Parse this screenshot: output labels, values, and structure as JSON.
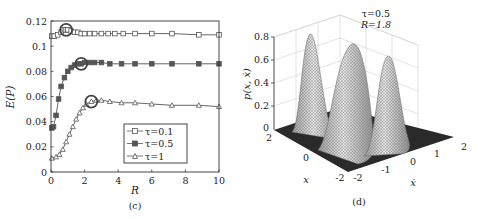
{
  "chart_data": [
    {
      "id": "c",
      "type": "line",
      "caption": "(c)",
      "title": "",
      "xlabel": "R",
      "ylabel": "E(P)",
      "xlim": [
        0,
        10
      ],
      "ylim": [
        0,
        0.12
      ],
      "xticks": [
        "0",
        "2",
        "4",
        "6",
        "8",
        "10"
      ],
      "yticks": [
        "0",
        "0.02",
        "0.04",
        "0.06",
        "0.08",
        "0.1",
        "0.12"
      ],
      "grid": false,
      "legend_position": "lower right",
      "series": [
        {
          "name": "τ=0.1",
          "marker": "square-open",
          "x": [
            0.05,
            0.2,
            0.4,
            0.6,
            0.8,
            0.9,
            1.0,
            1.2,
            1.4,
            1.6,
            1.8,
            2.0,
            2.3,
            2.6,
            3.0,
            3.4,
            3.8,
            4.3,
            5.0,
            6.0,
            7.2,
            8.8,
            10.0
          ],
          "values": [
            0.108,
            0.108,
            0.109,
            0.111,
            0.113,
            0.113,
            0.113,
            0.112,
            0.111,
            0.111,
            0.11,
            0.11,
            0.11,
            0.11,
            0.11,
            0.11,
            0.11,
            0.11,
            0.11,
            0.11,
            0.11,
            0.109,
            0.109
          ],
          "highlight": {
            "x": 0.9,
            "y": 0.113
          }
        },
        {
          "name": "τ=0.5",
          "marker": "square-filled",
          "x": [
            0.05,
            0.15,
            0.3,
            0.45,
            0.6,
            0.8,
            1.0,
            1.2,
            1.4,
            1.6,
            1.8,
            2.0,
            2.3,
            2.6,
            3.0,
            3.5,
            4.2,
            5.0,
            6.0,
            7.2,
            8.8,
            10.0
          ],
          "values": [
            0.035,
            0.036,
            0.045,
            0.058,
            0.068,
            0.075,
            0.08,
            0.083,
            0.085,
            0.086,
            0.086,
            0.087,
            0.087,
            0.087,
            0.087,
            0.086,
            0.086,
            0.086,
            0.086,
            0.086,
            0.086,
            0.086
          ],
          "highlight": {
            "x": 1.8,
            "y": 0.086
          }
        },
        {
          "name": "τ=1",
          "marker": "triangle-open",
          "x": [
            0.05,
            0.3,
            0.5,
            0.7,
            0.9,
            1.1,
            1.3,
            1.5,
            1.7,
            1.9,
            2.1,
            2.4,
            2.7,
            3.0,
            3.5,
            4.2,
            5.0,
            6.0,
            7.2,
            8.8,
            10.0
          ],
          "values": [
            0.011,
            0.012,
            0.014,
            0.018,
            0.024,
            0.03,
            0.036,
            0.042,
            0.047,
            0.051,
            0.054,
            0.056,
            0.057,
            0.057,
            0.056,
            0.055,
            0.055,
            0.054,
            0.053,
            0.053,
            0.052
          ],
          "highlight": {
            "x": 2.4,
            "y": 0.056
          }
        }
      ]
    },
    {
      "id": "d",
      "type": "surface",
      "caption": "(d)",
      "annotation": [
        "τ=0.5",
        "R=1.8"
      ],
      "xlabel": "x",
      "ylabel": "ẋ",
      "zlabel": "p(x, ẋ)",
      "xticks": [
        "-2",
        "0",
        "2"
      ],
      "yticks": [
        "-2",
        "-1",
        "0",
        "1",
        "2"
      ],
      "zticks": [
        "0",
        "0.2",
        "0.4",
        "0.6",
        "0.8"
      ],
      "zlim": [
        0,
        0.85
      ],
      "peaks": [
        {
          "label": "left",
          "height": 0.8
        },
        {
          "label": "middle",
          "height": 0.73
        },
        {
          "label": "right",
          "height": 0.62
        }
      ]
    }
  ],
  "panel_c": {
    "caption": "(c)",
    "xlabel": "R",
    "ylabel": "E(P)",
    "legend": [
      "τ=0.1",
      "τ=0.5",
      "τ=1"
    ],
    "xticks": [
      "0",
      "2",
      "4",
      "6",
      "8",
      "10"
    ],
    "yticks": [
      "0",
      "0.02",
      "0.04",
      "0.06",
      "0.08",
      "0.1",
      "0.12"
    ]
  },
  "panel_d": {
    "caption": "(d)",
    "annotation_tau": "τ=0.5",
    "annotation_R": "R=1.8",
    "xlabel": "x",
    "ylabel": "ẋ",
    "zlabel": "p(x, ẋ)",
    "zticks": [
      "0",
      "0.2",
      "0.4",
      "0.6",
      "0.8"
    ],
    "xticks": [
      "2",
      "0",
      "-2"
    ],
    "yticks": [
      "-2",
      "-1",
      "0",
      "1",
      "2"
    ]
  }
}
